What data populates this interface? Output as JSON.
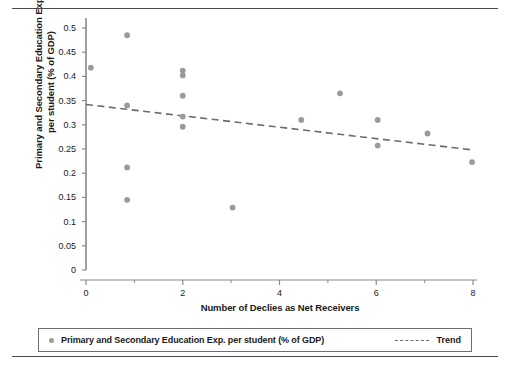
{
  "chart_data": {
    "type": "scatter",
    "title": "",
    "xlabel": "Number of Declies as Net Receivers",
    "ylabel_lines": [
      "Primary and Secondary Education Exp.",
      "per student (% of GDP)"
    ],
    "ylabel": "Primary and Secondary Education Exp. per student (% of GDP)",
    "xlim": [
      0,
      8
    ],
    "ylim": [
      0,
      0.5
    ],
    "xticks": [
      0,
      2,
      4,
      6,
      8
    ],
    "xtick_labels": [
      "0",
      "2",
      "4",
      "6",
      "8"
    ],
    "xminor_ticks": [
      1,
      3,
      5,
      7
    ],
    "yticks": [
      0,
      0.05,
      0.1,
      0.15,
      0.2,
      0.25,
      0.3,
      0.35,
      0.4,
      0.45,
      0.5
    ],
    "ytick_labels": [
      "0",
      "0.05",
      "0.1",
      "0.15",
      "0.2",
      "0.25",
      "0.3",
      "0.35",
      "0.4",
      "0.45",
      "0.5"
    ],
    "grid": false,
    "legend_position": "bottom",
    "marker_color": "#9a9a9a",
    "trend_color": "#6b6b6b",
    "axis_color": "#8a8a8a",
    "series": [
      {
        "name": "Primary and Secondary Education Exp. per student (% of GDP)",
        "type": "scatter",
        "color": "#9a9a9a",
        "points": [
          [
            0.1,
            0.418
          ],
          [
            0.85,
            0.485
          ],
          [
            0.85,
            0.34
          ],
          [
            0.85,
            0.212
          ],
          [
            0.85,
            0.145
          ],
          [
            2.0,
            0.412
          ],
          [
            2.0,
            0.402
          ],
          [
            2.0,
            0.36
          ],
          [
            2.0,
            0.317
          ],
          [
            2.0,
            0.296
          ],
          [
            3.03,
            0.129
          ],
          [
            4.45,
            0.31
          ],
          [
            5.25,
            0.365
          ],
          [
            6.03,
            0.31
          ],
          [
            6.03,
            0.257
          ],
          [
            7.06,
            0.282
          ],
          [
            7.98,
            0.223
          ]
        ]
      },
      {
        "name": "Trend",
        "type": "line",
        "style": "dashed",
        "color": "#6b6b6b",
        "points": [
          [
            0.0,
            0.342
          ],
          [
            8.0,
            0.248
          ]
        ]
      }
    ],
    "legend": [
      {
        "label": "Primary and Secondary Education Exp. per student (% of GDP)",
        "marker": "circle",
        "color": "#9a9a9a"
      },
      {
        "label": "Trend",
        "marker": "dashed-line",
        "color": "#6b6b6b"
      }
    ]
  }
}
